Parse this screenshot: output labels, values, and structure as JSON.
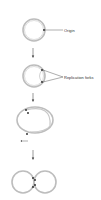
{
  "diagram": {
    "labels": {
      "origin": "Origin",
      "replication_forks": "Replication forks"
    },
    "stages": [
      "circular-dna-with-origin",
      "replication-forks-forming",
      "theta-intermediate",
      "two-daughter-circles"
    ],
    "colors": {
      "strand": "#bdbdbd",
      "arrow": "#333333",
      "dot": "#222222"
    }
  }
}
